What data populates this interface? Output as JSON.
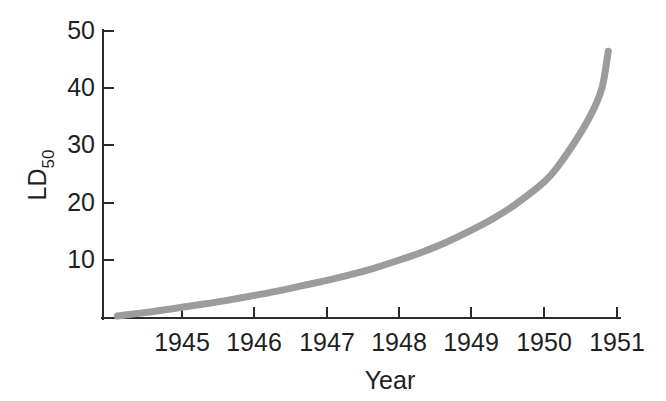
{
  "chart_data": {
    "type": "line",
    "title": "",
    "xlabel": "Year",
    "ylabel": "LD50",
    "ylabel_base": "LD",
    "ylabel_sub": "50",
    "xlim": [
      1944.1,
      1951.1
    ],
    "ylim": [
      0,
      50
    ],
    "grid": false,
    "legend": null,
    "xticks": [
      1945,
      1946,
      1947,
      1948,
      1949,
      1950,
      1951
    ],
    "xtick_labels": [
      "1945",
      "1946",
      "1947",
      "1948",
      "1949",
      "1950",
      "1951"
    ],
    "yticks": [
      10,
      20,
      30,
      40,
      50
    ],
    "ytick_labels": [
      "10",
      "20",
      "30",
      "40",
      "50"
    ],
    "series": [
      {
        "name": "LD50 trend",
        "color": "#9c9c9c",
        "linewidth": 7,
        "x": [
          1944.11,
          1944.4,
          1944.7,
          1945.0,
          1945.3,
          1945.6,
          1946.0,
          1946.3,
          1946.6,
          1947.0,
          1947.3,
          1947.6,
          1948.0,
          1948.3,
          1948.6,
          1949.0,
          1949.3,
          1949.6,
          1950.0,
          1950.2,
          1950.4,
          1950.55,
          1950.7,
          1950.8,
          1950.88
        ],
        "y": [
          0.35,
          0.8,
          1.3,
          1.85,
          2.4,
          3.0,
          3.9,
          4.6,
          5.4,
          6.5,
          7.4,
          8.4,
          10.0,
          11.3,
          12.8,
          15.2,
          17.2,
          19.6,
          23.5,
          26.4,
          30.0,
          33.0,
          36.6,
          40.0,
          46.0
        ]
      }
    ],
    "axis_color": "#2b2b2b",
    "background": "#ffffff"
  },
  "caption": {
    "text": ""
  }
}
